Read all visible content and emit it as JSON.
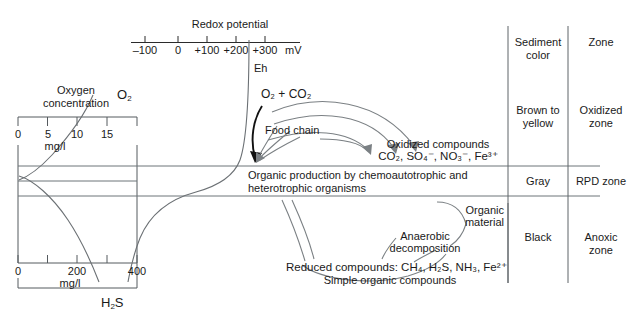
{
  "redox_axis": {
    "title": "Redox potential",
    "unit": "mV",
    "ticks": [
      "–100",
      "0",
      "+100",
      "+200",
      "+300"
    ],
    "curve_label": "Eh"
  },
  "oxygen_box": {
    "title_line1": "Oxygen",
    "title_line2": "concentration",
    "top_axis": {
      "ticks": [
        "0",
        "5",
        "10",
        "15"
      ],
      "unit": "mg/l"
    },
    "bottom_axis": {
      "ticks": [
        "0",
        "200",
        "400"
      ],
      "unit": "mg/l"
    },
    "curve_o2": "O",
    "curve_o2_sub": "2",
    "curve_h2s_pre": "H",
    "curve_h2s_sub": "2",
    "curve_h2s_post": "S"
  },
  "flows": {
    "inputs_label": "O₂ + CO₂",
    "food_chain": "Food chain",
    "oxidized_title": "Oxidized compounds",
    "oxidized_formulas": "CO₂, SO₄⁻, NO₃⁻, Fe³⁺",
    "production_line1": "Organic production by chemoautotrophic and",
    "production_line2": "heterotrophic organisms",
    "organic_material_line1": "Organic",
    "organic_material_line2": "material",
    "anaerobic_line1": "Anaerobic",
    "anaerobic_line2": "decomposition",
    "reduced_compounds": "Reduced compounds: CH₄, H₂S, NH₃, Fe²⁺",
    "simple_organic": "Simple organic compounds"
  },
  "table": {
    "headers": {
      "sediment_color_line1": "Sediment",
      "sediment_color_line2": "color",
      "zone": "Zone"
    },
    "rows": [
      {
        "color_line1": "Brown to",
        "color_line2": "yellow",
        "zone_line1": "Oxidized",
        "zone_line2": "zone"
      },
      {
        "color_line1": "Gray",
        "color_line2": "",
        "zone_line1": "RPD zone",
        "zone_line2": ""
      },
      {
        "color_line1": "Black",
        "color_line2": "",
        "zone_line1": "Anoxic",
        "zone_line2": "zone"
      }
    ]
  },
  "colors": {
    "ink": "#1a1a1a",
    "rule": "#6d7478",
    "curve": "#6b7074",
    "arrow_dark": "#111111",
    "background": "#ffffff"
  }
}
